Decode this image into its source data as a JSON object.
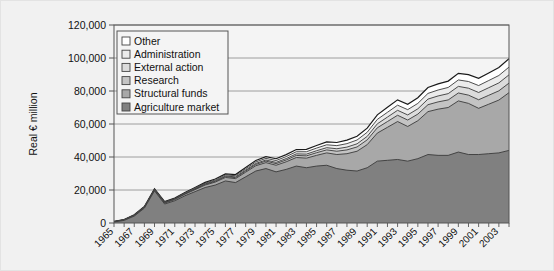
{
  "chart_data": {
    "type": "area",
    "stacked": true,
    "title": "",
    "subtitle": "",
    "xlabel": "",
    "ylabel": "Real € million",
    "ylim": [
      0,
      120000
    ],
    "ytick_labels": [
      "0",
      "20,000",
      "40,000",
      "60,000",
      "80,000",
      "100,000",
      "120,000"
    ],
    "ytick_values": [
      0,
      20000,
      40000,
      60000,
      80000,
      100000,
      120000
    ],
    "grid": "horizontal",
    "legend_position": "upper-left-inside",
    "xlim": [
      1965,
      2004
    ],
    "x": [
      1965,
      1966,
      1967,
      1968,
      1969,
      1970,
      1971,
      1972,
      1973,
      1974,
      1975,
      1976,
      1977,
      1978,
      1979,
      1980,
      1981,
      1982,
      1983,
      1984,
      1985,
      1986,
      1987,
      1988,
      1989,
      1990,
      1991,
      1992,
      1993,
      1994,
      1995,
      1996,
      1997,
      1998,
      1999,
      2000,
      2001,
      2002,
      2003,
      2004
    ],
    "xtick_labels": [
      "1965",
      "1967",
      "1969",
      "1971",
      "1973",
      "1975",
      "1977",
      "1979",
      "1981",
      "1983",
      "1985",
      "1987",
      "1989",
      "1991",
      "1993",
      "1995",
      "1997",
      "1999",
      "2001",
      "2003"
    ],
    "series": [
      {
        "name": "Agriculture market",
        "color": "#808080",
        "values": [
          600,
          1600,
          4200,
          9000,
          19500,
          11500,
          13500,
          16500,
          19000,
          21500,
          23000,
          25500,
          24500,
          28000,
          31500,
          33000,
          31000,
          32500,
          34500,
          33500,
          34500,
          35000,
          33000,
          32000,
          31500,
          33500,
          37500,
          38000,
          38500,
          37500,
          39000,
          41500,
          41000,
          41000,
          43000,
          41500,
          41500,
          42000,
          42500,
          44000
        ]
      },
      {
        "name": "Structural funds",
        "color": "#a8a8a8",
        "values": [
          100,
          200,
          300,
          400,
          500,
          600,
          700,
          900,
          1200,
          1500,
          1800,
          2100,
          2400,
          2800,
          3200,
          3600,
          4000,
          4600,
          5200,
          5800,
          6500,
          7500,
          8500,
          10000,
          12000,
          14000,
          17000,
          20000,
          23000,
          21000,
          23000,
          26000,
          28000,
          29000,
          31000,
          31000,
          28000,
          30000,
          32000,
          35000
        ]
      },
      {
        "name": "Research",
        "color": "#c4c4c4",
        "values": [
          50,
          80,
          110,
          140,
          170,
          200,
          230,
          270,
          320,
          380,
          450,
          520,
          600,
          700,
          800,
          900,
          1000,
          1100,
          1250,
          1400,
          1600,
          1800,
          2000,
          2300,
          2600,
          2900,
          3200,
          3500,
          3800,
          3900,
          4000,
          4200,
          4400,
          4600,
          4800,
          5000,
          5200,
          5400,
          5600,
          5800
        ]
      },
      {
        "name": "External action",
        "color": "#dcdcdc",
        "values": [
          40,
          60,
          80,
          100,
          120,
          140,
          160,
          190,
          230,
          280,
          330,
          390,
          450,
          520,
          600,
          680,
          760,
          850,
          950,
          1050,
          1200,
          1350,
          1500,
          1700,
          1900,
          2100,
          2400,
          2700,
          3000,
          3100,
          3200,
          3400,
          3600,
          3800,
          4000,
          4200,
          4400,
          4600,
          4800,
          5000
        ]
      },
      {
        "name": "Administration",
        "color": "#ececec",
        "values": [
          80,
          110,
          140,
          180,
          220,
          260,
          300,
          350,
          420,
          490,
          560,
          640,
          720,
          800,
          900,
          1000,
          1100,
          1200,
          1300,
          1450,
          1600,
          1750,
          1900,
          2100,
          2300,
          2500,
          2700,
          2900,
          3100,
          3200,
          3300,
          3450,
          3600,
          3750,
          3900,
          4050,
          4200,
          4350,
          4500,
          4700
        ]
      },
      {
        "name": "Other",
        "color": "#ffffff",
        "values": [
          60,
          90,
          120,
          150,
          190,
          230,
          270,
          320,
          380,
          450,
          520,
          600,
          690,
          780,
          880,
          980,
          1080,
          1200,
          1320,
          1450,
          1600,
          1750,
          1900,
          2100,
          2300,
          2500,
          2750,
          3000,
          3250,
          3300,
          3400,
          3550,
          3700,
          3850,
          4000,
          4200,
          4400,
          4600,
          4800,
          5000
        ]
      }
    ]
  },
  "legend": {
    "items": [
      {
        "label": "Other",
        "color": "#ffffff"
      },
      {
        "label": "Administration",
        "color": "#ececec"
      },
      {
        "label": "External action",
        "color": "#dcdcdc"
      },
      {
        "label": "Research",
        "color": "#c4c4c4"
      },
      {
        "label": "Structural funds",
        "color": "#a8a8a8"
      },
      {
        "label": "Agriculture market",
        "color": "#808080"
      }
    ]
  },
  "axes": {
    "y_axis_title": "Real € million"
  },
  "colors": {
    "background": "#f1f1f1",
    "plot_background": "#f4f4f4",
    "axis_line": "#555555",
    "grid_line": "#888888",
    "series_outline": "#333333"
  }
}
